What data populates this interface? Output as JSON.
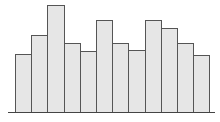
{
  "chart_data": {
    "type": "bar",
    "title": "",
    "xlabel": "",
    "ylabel": "",
    "categories": [
      "1",
      "2",
      "3",
      "4",
      "5",
      "6",
      "7",
      "8",
      "9",
      "10",
      "11",
      "12"
    ],
    "values": [
      58,
      77,
      107,
      69,
      61,
      92,
      69,
      62,
      92,
      84,
      69,
      57
    ],
    "ylim": [
      0,
      110
    ],
    "grid": false,
    "legend": null,
    "axis_ticks_visible": false,
    "bar_fill": "#e6e6e6",
    "bar_edge": "#555555",
    "baseline_color": "#444444"
  },
  "layout": {
    "baseline_y": 112,
    "first_bar_left": 15,
    "bar_width": 16.2,
    "px_per_unit": 1
  }
}
